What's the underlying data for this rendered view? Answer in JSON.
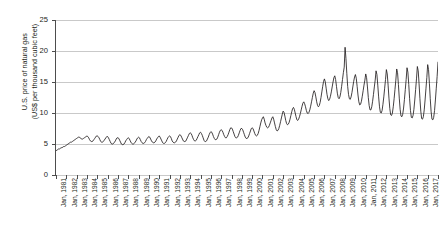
{
  "chart_data": {
    "type": "line",
    "title": "",
    "xlabel": "",
    "ylabel": "U.S. price of natural gas (US$ per thousand cubic feet)",
    "ylabel_line1": "U.S. price of natural gas",
    "ylabel_line2": "(US$ per thousand cubic feet)",
    "ylim": [
      0,
      25
    ],
    "yticks": [
      0,
      5,
      10,
      15,
      20,
      25
    ],
    "ytick_labels": [
      "0",
      "5",
      "10",
      "15",
      "20",
      "25"
    ],
    "grid": true,
    "legend": "none",
    "line_color": "#231f20",
    "axis_color": "#4d4d4d",
    "grid_color": "#c9c9c9",
    "background_color": "#ffffff",
    "x_tick_labels": [
      "Jan, 1981",
      "Jan, 1982",
      "Jan, 1983",
      "Jan, 1984",
      "Jan, 1985",
      "Jan, 1986",
      "Jan, 1987",
      "Jan, 1988",
      "Jan, 1989",
      "Jan, 1990",
      "Jan, 1991",
      "Jan, 1992",
      "Jan, 1993",
      "Jan, 1994",
      "Jan, 1995",
      "Jan, 1996",
      "Jan, 1997",
      "Jan, 1998",
      "Jan, 1999",
      "Jan, 2000",
      "Jan, 2001",
      "Jan, 2002",
      "Jan, 2003",
      "Jan, 2004",
      "Jan, 2005",
      "Jan, 2006",
      "Jan, 2007",
      "Jan, 2008",
      "Jan, 2009",
      "Jan, 2010",
      "Jan, 2011",
      "Jan, 2012",
      "Jan, 2013",
      "Jan, 2014",
      "Jan, 2015",
      "Jan, 2016",
      "Jan, 2017",
      "Jan, 2018"
    ],
    "x_range": [
      "Jan, 1981",
      "Jan, 2018"
    ],
    "series": [
      {
        "name": "U.S. price of natural gas",
        "frequency": "monthly",
        "start": "1981-01",
        "units": "US$ per thousand cubic feet",
        "peak_value": 20.6,
        "peak_date": "Jan, 2008",
        "start_value": 3.9,
        "end_value": 18.2,
        "values": [
          3.9,
          4.0,
          4.1,
          4.2,
          4.2,
          4.3,
          4.4,
          4.4,
          4.5,
          4.6,
          4.6,
          4.7,
          4.8,
          4.9,
          5.0,
          5.1,
          5.2,
          5.3,
          5.3,
          5.4,
          5.5,
          5.6,
          5.7,
          5.8,
          5.9,
          6.0,
          6.1,
          6.1,
          6.0,
          5.9,
          5.8,
          5.8,
          5.9,
          6.0,
          6.1,
          6.2,
          6.3,
          6.2,
          6.0,
          5.7,
          5.5,
          5.4,
          5.4,
          5.5,
          5.7,
          5.9,
          6.1,
          6.3,
          6.3,
          6.2,
          6.0,
          5.7,
          5.4,
          5.3,
          5.3,
          5.4,
          5.6,
          5.8,
          6.0,
          6.2,
          6.2,
          6.0,
          5.7,
          5.4,
          5.1,
          5.0,
          5.0,
          5.1,
          5.3,
          5.5,
          5.8,
          6.0,
          6.0,
          5.9,
          5.6,
          5.3,
          5.0,
          4.9,
          4.9,
          5.0,
          5.2,
          5.5,
          5.7,
          5.9,
          6.0,
          5.9,
          5.6,
          5.3,
          5.1,
          5.0,
          5.0,
          5.1,
          5.3,
          5.5,
          5.8,
          6.0,
          6.1,
          6.0,
          5.7,
          5.4,
          5.2,
          5.1,
          5.1,
          5.2,
          5.4,
          5.7,
          5.9,
          6.1,
          6.2,
          6.1,
          5.8,
          5.5,
          5.3,
          5.2,
          5.2,
          5.3,
          5.5,
          5.8,
          6.0,
          6.2,
          6.3,
          6.1,
          5.8,
          5.5,
          5.2,
          5.1,
          5.1,
          5.2,
          5.4,
          5.7,
          6.0,
          6.2,
          6.3,
          6.2,
          5.9,
          5.5,
          5.3,
          5.2,
          5.2,
          5.3,
          5.5,
          5.8,
          6.1,
          6.4,
          6.5,
          6.4,
          6.1,
          5.8,
          5.5,
          5.4,
          5.4,
          5.5,
          5.8,
          6.1,
          6.4,
          6.7,
          6.8,
          6.7,
          6.4,
          6.0,
          5.7,
          5.5,
          5.5,
          5.6,
          5.9,
          6.2,
          6.5,
          6.8,
          6.9,
          6.7,
          6.4,
          6.0,
          5.6,
          5.4,
          5.4,
          5.5,
          5.8,
          6.1,
          6.5,
          6.8,
          7.0,
          6.9,
          6.6,
          6.2,
          5.9,
          5.7,
          5.7,
          5.8,
          6.1,
          6.5,
          6.9,
          7.2,
          7.3,
          7.2,
          6.9,
          6.5,
          6.2,
          6.0,
          6.0,
          6.2,
          6.5,
          6.9,
          7.3,
          7.6,
          7.6,
          7.4,
          7.0,
          6.6,
          6.2,
          6.0,
          6.0,
          6.1,
          6.4,
          6.8,
          7.2,
          7.5,
          7.5,
          7.3,
          6.9,
          6.5,
          6.1,
          5.9,
          5.9,
          6.0,
          6.3,
          6.7,
          7.1,
          7.5,
          7.6,
          7.5,
          7.1,
          6.7,
          6.4,
          6.3,
          6.4,
          6.7,
          7.2,
          7.8,
          8.4,
          8.9,
          9.2,
          9.4,
          9.0,
          8.4,
          8.0,
          7.7,
          7.6,
          7.7,
          8.0,
          8.4,
          8.8,
          9.2,
          9.4,
          9.0,
          8.4,
          7.8,
          7.3,
          7.1,
          7.2,
          7.5,
          8.0,
          8.6,
          9.2,
          9.8,
          10.3,
          10.1,
          9.5,
          8.8,
          8.3,
          8.1,
          8.2,
          8.5,
          9.0,
          9.6,
          10.2,
          10.7,
          10.9,
          10.6,
          10.0,
          9.4,
          8.9,
          8.8,
          9.0,
          9.4,
          9.9,
          10.5,
          11.1,
          11.6,
          11.8,
          11.5,
          11.0,
          10.4,
          10.0,
          9.9,
          10.1,
          10.5,
          11.1,
          11.8,
          12.5,
          13.2,
          13.6,
          13.3,
          12.6,
          11.8,
          11.2,
          11.0,
          11.2,
          11.7,
          12.5,
          13.4,
          14.3,
          15.1,
          15.5,
          15.0,
          14.0,
          13.0,
          12.3,
          12.0,
          12.2,
          12.7,
          13.4,
          14.2,
          15.0,
          15.7,
          16.0,
          15.4,
          14.3,
          13.2,
          12.5,
          12.3,
          12.6,
          13.3,
          14.3,
          15.4,
          16.5,
          17.4,
          20.6,
          18.8,
          16.4,
          14.3,
          13.0,
          12.3,
          12.2,
          12.6,
          13.3,
          14.2,
          15.1,
          15.8,
          16.2,
          15.6,
          14.3,
          12.9,
          11.8,
          11.3,
          11.4,
          11.9,
          12.7,
          13.6,
          14.5,
          15.3,
          16.3,
          15.7,
          14.2,
          12.5,
          11.2,
          10.5,
          10.5,
          11.0,
          11.9,
          13.0,
          14.2,
          15.3,
          16.8,
          16.2,
          14.5,
          12.6,
          11.0,
          10.1,
          10.0,
          10.4,
          11.4,
          12.6,
          14.0,
          15.4,
          17.0,
          16.3,
          14.5,
          12.4,
          10.7,
          9.7,
          9.6,
          10.0,
          11.0,
          12.3,
          13.8,
          15.3,
          17.1,
          16.5,
          14.6,
          12.4,
          10.6,
          9.5,
          9.4,
          9.8,
          10.8,
          12.2,
          13.8,
          15.4,
          17.3,
          16.6,
          14.6,
          12.3,
          10.4,
          9.3,
          9.2,
          9.6,
          10.6,
          12.1,
          13.8,
          15.5,
          17.5,
          16.8,
          14.7,
          12.3,
          10.3,
          9.1,
          9.0,
          9.4,
          10.5,
          12.1,
          13.9,
          15.7,
          17.8,
          17.0,
          14.8,
          12.3,
          10.2,
          9.0,
          8.9,
          9.3,
          10.4,
          12.1,
          14.0,
          15.9,
          18.2
        ]
      }
    ]
  }
}
